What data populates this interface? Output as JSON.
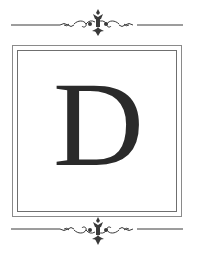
{
  "monogram": {
    "letter": "D",
    "letter_color": "#2a2a2a",
    "frame_color": "#7a7a7a",
    "ornament_color": "#3a3a3a"
  },
  "ornaments": {
    "top": "flourish-divider-icon",
    "bottom": "flourish-divider-icon"
  }
}
